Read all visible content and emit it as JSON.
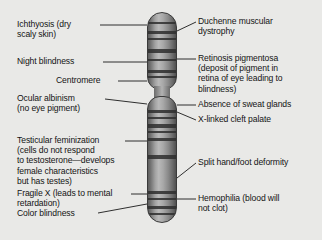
{
  "diagram": {
    "background_color": "#e9e9e7",
    "chromosome_color": "#8a8a8a",
    "band_color": "#2e2e2e",
    "line_color": "#1a1a1a"
  },
  "labels_left": [
    {
      "id": "ichthyosis",
      "text": "Ichthyosis (dry\nscaly skin)"
    },
    {
      "id": "night-blindness",
      "text": "Night blindness"
    },
    {
      "id": "centromere",
      "text": "Centromere"
    },
    {
      "id": "ocular-albinism",
      "text": "Ocular albinism\n(no eye pigment)"
    },
    {
      "id": "testicular-feminization",
      "text": "Testicular feminization\n(cells do not respond\nto testosterone—develops\nfemale characteristics\nbut has testes)"
    },
    {
      "id": "fragile-x",
      "text": "Fragile X (leads to mental\nretardation)"
    },
    {
      "id": "color-blindness",
      "text": "Color blindness"
    }
  ],
  "labels_right": [
    {
      "id": "duchenne",
      "text": "Duchenne muscular\ndystrophy"
    },
    {
      "id": "retinosis-pigmentosa",
      "text": "Retinosis pigmentosa\n(deposit of pigment in\nretina of eye leading to\nblindness)"
    },
    {
      "id": "absence-sweat-glands",
      "text": "Absence of sweat glands"
    },
    {
      "id": "cleft-palate",
      "text": "X-linked cleft palate"
    },
    {
      "id": "split-hand-foot",
      "text": "Split hand/foot deformity"
    },
    {
      "id": "hemophilia",
      "text": "Hemophilia (blood will\nnot clot)"
    }
  ]
}
